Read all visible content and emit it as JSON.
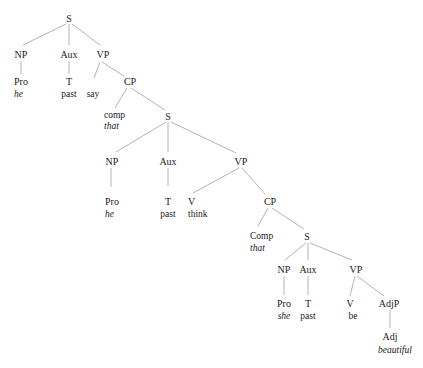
{
  "diagram": {
    "type": "syntax-tree",
    "nodes": {
      "s1": {
        "label": "S"
      },
      "np1": {
        "label": "NP"
      },
      "aux1": {
        "label": "Aux"
      },
      "vp1": {
        "label": "VP"
      },
      "pro1": {
        "label": "Pro",
        "word": "he"
      },
      "t1": {
        "label": "T",
        "word": "past"
      },
      "v1": {
        "word": "say"
      },
      "cp1": {
        "label": "CP"
      },
      "comp1": {
        "label": "comp",
        "word": "that"
      },
      "s2": {
        "label": "S"
      },
      "np2": {
        "label": "NP"
      },
      "aux2": {
        "label": "Aux"
      },
      "vp2": {
        "label": "VP"
      },
      "pro2": {
        "label": "Pro",
        "word": "he"
      },
      "t2": {
        "label": "T",
        "word": "past"
      },
      "v2": {
        "label": "V",
        "word": "think"
      },
      "cp2": {
        "label": "CP"
      },
      "comp2": {
        "label": "Comp",
        "word": "that"
      },
      "s3": {
        "label": "S"
      },
      "np3": {
        "label": "NP"
      },
      "aux3": {
        "label": "Aux"
      },
      "vp3": {
        "label": "VP"
      },
      "pro3": {
        "label": "Pro",
        "word": "she"
      },
      "t3": {
        "label": "T",
        "word": "past"
      },
      "v3": {
        "label": "V",
        "word": "be"
      },
      "adjp": {
        "label": "AdjP"
      },
      "adj": {
        "label": "Adj",
        "word": "beautiful"
      }
    },
    "edges": [
      [
        "s1",
        "np1"
      ],
      [
        "s1",
        "aux1"
      ],
      [
        "s1",
        "vp1"
      ],
      [
        "np1",
        "pro1"
      ],
      [
        "aux1",
        "t1"
      ],
      [
        "vp1",
        "v1"
      ],
      [
        "vp1",
        "cp1"
      ],
      [
        "cp1",
        "comp1"
      ],
      [
        "cp1",
        "s2"
      ],
      [
        "s2",
        "np2"
      ],
      [
        "s2",
        "aux2"
      ],
      [
        "s2",
        "vp2"
      ],
      [
        "np2",
        "pro2"
      ],
      [
        "aux2",
        "t2"
      ],
      [
        "vp2",
        "v2"
      ],
      [
        "vp2",
        "cp2"
      ],
      [
        "cp2",
        "comp2"
      ],
      [
        "cp2",
        "s3"
      ],
      [
        "s3",
        "np3"
      ],
      [
        "s3",
        "aux3"
      ],
      [
        "s3",
        "vp3"
      ],
      [
        "np3",
        "pro3"
      ],
      [
        "aux3",
        "t3"
      ],
      [
        "vp3",
        "v3"
      ],
      [
        "vp3",
        "adjp"
      ],
      [
        "adjp",
        "adj"
      ]
    ]
  }
}
